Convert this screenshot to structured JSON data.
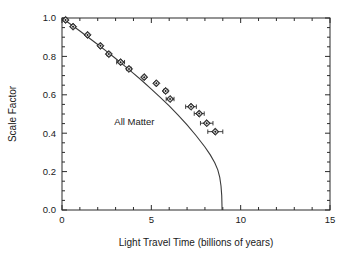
{
  "chart_data": {
    "type": "scatter",
    "title": "",
    "xlabel": "Light Travel Time (billions of years)",
    "ylabel": "Scale Factor",
    "xlim": [
      0,
      15
    ],
    "ylim": [
      0.0,
      1.0
    ],
    "grid": false,
    "legend_position": "none",
    "xticks": [
      0,
      5,
      10,
      15
    ],
    "xticklabels": [
      "0",
      "5",
      "10",
      "15"
    ],
    "yticks": [
      0.0,
      0.2,
      0.4,
      0.6,
      0.8,
      1.0
    ],
    "yticklabels": [
      "0.0",
      "0.2",
      "0.4",
      "0.6",
      "0.8",
      "1.0"
    ],
    "x_minor_tick_step": 1,
    "y_minor_tick_step": 0.05,
    "annotations": [
      {
        "text": "All Matter",
        "x": 4.05,
        "y": 0.445
      }
    ],
    "series": [
      {
        "name": "Supernova data",
        "type": "scatter",
        "marker": "diamond",
        "has_xerr": true,
        "points": [
          {
            "x": 0.2,
            "y": 0.99,
            "xerr": 0.0
          },
          {
            "x": 0.62,
            "y": 0.955,
            "xerr": 0.0
          },
          {
            "x": 1.43,
            "y": 0.912,
            "xerr": 0.0
          },
          {
            "x": 2.15,
            "y": 0.855,
            "xerr": 0.06
          },
          {
            "x": 2.62,
            "y": 0.812,
            "xerr": 0.1
          },
          {
            "x": 3.28,
            "y": 0.77,
            "xerr": 0.22
          },
          {
            "x": 3.75,
            "y": 0.735,
            "xerr": 0.12
          },
          {
            "x": 4.6,
            "y": 0.692,
            "xerr": 0.05
          },
          {
            "x": 5.28,
            "y": 0.66,
            "xerr": 0.06
          },
          {
            "x": 5.8,
            "y": 0.62,
            "xerr": 0.12
          },
          {
            "x": 6.05,
            "y": 0.578,
            "xerr": 0.22
          },
          {
            "x": 7.22,
            "y": 0.538,
            "xerr": 0.3
          },
          {
            "x": 7.68,
            "y": 0.502,
            "xerr": 0.28
          },
          {
            "x": 8.1,
            "y": 0.452,
            "xerr": 0.35
          },
          {
            "x": 8.58,
            "y": 0.408,
            "xerr": 0.42
          }
        ]
      },
      {
        "name": "All Matter",
        "type": "line",
        "points": [
          {
            "x": 0.0,
            "y": 1.0
          },
          {
            "x": 0.5,
            "y": 0.966
          },
          {
            "x": 1.0,
            "y": 0.932
          },
          {
            "x": 1.5,
            "y": 0.897
          },
          {
            "x": 2.0,
            "y": 0.862
          },
          {
            "x": 2.5,
            "y": 0.826
          },
          {
            "x": 3.0,
            "y": 0.789
          },
          {
            "x": 3.5,
            "y": 0.751
          },
          {
            "x": 4.0,
            "y": 0.712
          },
          {
            "x": 4.5,
            "y": 0.672
          },
          {
            "x": 5.0,
            "y": 0.63
          },
          {
            "x": 5.5,
            "y": 0.587
          },
          {
            "x": 6.0,
            "y": 0.542
          },
          {
            "x": 6.5,
            "y": 0.494
          },
          {
            "x": 7.0,
            "y": 0.443
          },
          {
            "x": 7.5,
            "y": 0.388
          },
          {
            "x": 8.0,
            "y": 0.328
          },
          {
            "x": 8.3,
            "y": 0.287
          },
          {
            "x": 8.55,
            "y": 0.246
          },
          {
            "x": 8.72,
            "y": 0.209
          },
          {
            "x": 8.83,
            "y": 0.17
          },
          {
            "x": 8.9,
            "y": 0.125
          },
          {
            "x": 8.94,
            "y": 0.075
          },
          {
            "x": 8.96,
            "y": 0.0
          }
        ]
      }
    ]
  }
}
